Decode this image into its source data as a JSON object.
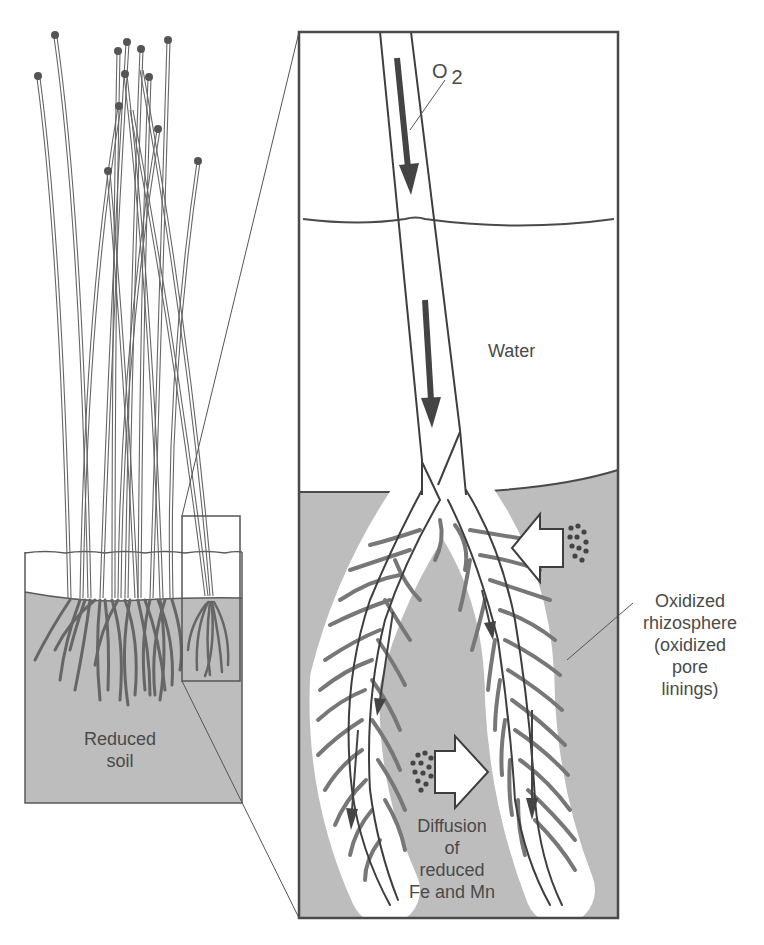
{
  "figure": {
    "type": "wetland plant oxidized rhizosphere diagram",
    "colors": {
      "line": "#4a4a4a",
      "soil": "#bdbdbd",
      "water": "#ffffff",
      "rhizosphere": "#ffffff",
      "arrow": "#444444"
    }
  },
  "labels": {
    "oxygen": "O",
    "oxygen_subscript": "2",
    "water": "Water",
    "oxidized_rhizosphere": [
      "Oxidized",
      "rhizosphere",
      "(oxidized",
      "pore",
      "linings)"
    ],
    "diffusion": [
      "Diffusion",
      "of",
      "reduced",
      "Fe and Mn"
    ],
    "reduced_soil": [
      "Reduced",
      "soil"
    ]
  }
}
